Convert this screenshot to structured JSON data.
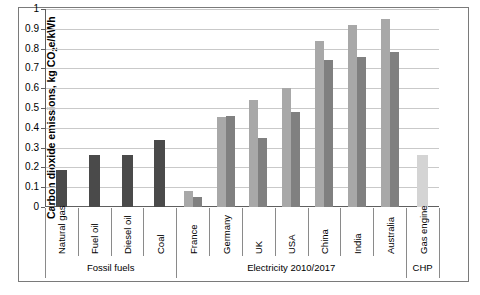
{
  "chart_data": {
    "type": "bar",
    "title": "",
    "xlabel": "",
    "ylabel": "Carbon dioxide emissions, kg CO2e/kWh",
    "ylabel_parts": {
      "pre": "Carbon dioxide emissions, kg CO",
      "sub": "2",
      "post": "e/kWh"
    },
    "ylim": [
      0,
      1
    ],
    "ytick_step": 0.1,
    "ytick_labels": [
      "1",
      "0.9",
      "0.8",
      "0.7",
      "0.6",
      "0.5",
      "0.4",
      "0.3",
      "0.2",
      "0.1",
      "0"
    ],
    "ytick_values": [
      1,
      0.9,
      0.8,
      0.7,
      0.6,
      0.5,
      0.4,
      0.3,
      0.2,
      0.1,
      0
    ],
    "grid": true,
    "legend": "none",
    "categories": [
      "Natural gas",
      "Fuel oil",
      "Diesel oil",
      "Coal",
      "France",
      "Germany",
      "UK",
      "USA",
      "China",
      "India",
      "Australia",
      "Gas engine"
    ],
    "series": [
      {
        "name": "2010",
        "values": [
          0.185,
          0.265,
          0.265,
          0.34,
          0.08,
          0.455,
          0.54,
          0.6,
          0.84,
          0.92,
          0.95,
          0.265
        ]
      },
      {
        "name": "2017",
        "values": [
          null,
          null,
          null,
          null,
          0.05,
          0.46,
          0.35,
          0.48,
          0.745,
          0.76,
          0.785,
          null
        ]
      }
    ],
    "bar_styles": {
      "fossil_single": "#4a4a4a",
      "series_2010": "#a8a8a8",
      "series_2017": "#808080",
      "chp_single": "#d4d4d4"
    },
    "groups": [
      {
        "label": "Fossil fuels",
        "span": 4
      },
      {
        "label": "Electricity 2010/2017",
        "span": 7
      },
      {
        "label": "CHP",
        "span": 1
      }
    ],
    "colors": {
      "grid": "#c9c9c9",
      "axis": "#5f5f5f",
      "frame": "#7a7a7a",
      "text": "#000000",
      "background": "#ffffff"
    }
  }
}
